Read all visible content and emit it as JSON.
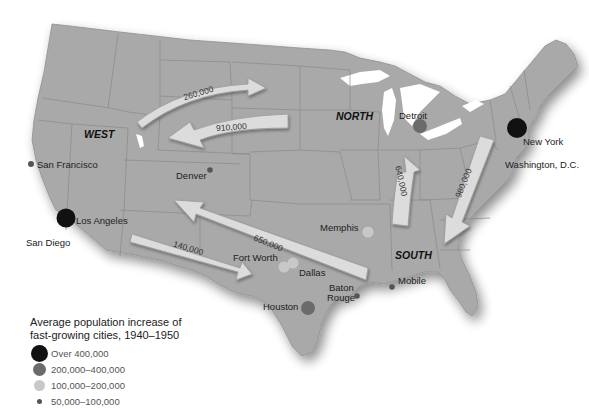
{
  "regions": {
    "west": "WEST",
    "north": "NORTH",
    "south": "SOUTH"
  },
  "cities": [
    {
      "name": "San Francisco",
      "category": "50,000–100,000"
    },
    {
      "name": "Los Angeles",
      "category": "Over 400,000"
    },
    {
      "name": "San Diego",
      "category": "50,000–100,000"
    },
    {
      "name": "Denver",
      "category": "50,000–100,000"
    },
    {
      "name": "Detroit",
      "category": "200,000–400,000"
    },
    {
      "name": "New York",
      "category": "Over 400,000"
    },
    {
      "name": "Washington, D.C.",
      "category": "200,000–400,000"
    },
    {
      "name": "Memphis",
      "category": "100,000–200,000"
    },
    {
      "name": "Fort Worth",
      "category": "100,000–200,000"
    },
    {
      "name": "Dallas",
      "category": "100,000–200,000"
    },
    {
      "name": "Houston",
      "category": "200,000–400,000"
    },
    {
      "name": "Baton Rouge",
      "category": "50,000–100,000"
    },
    {
      "name": "Mobile",
      "category": "50,000–100,000"
    }
  ],
  "labels": {
    "san_francisco": "San Francisco",
    "los_angeles": "Los Angeles",
    "san_diego": "San Diego",
    "denver": "Denver",
    "detroit": "Detroit",
    "new_york": "New York",
    "washington": "Washington, D.C.",
    "memphis": "Memphis",
    "fort_worth": "Fort Worth",
    "dallas": "Dallas",
    "houston": "Houston",
    "baton": "Baton",
    "rouge": "Rouge",
    "mobile": "Mobile"
  },
  "migration_arrows": [
    {
      "value": "260,000",
      "from": "West",
      "to": "Plains (east)"
    },
    {
      "value": "910,000",
      "from": "North",
      "to": "West"
    },
    {
      "value": "650,000",
      "from": "South",
      "to": "West"
    },
    {
      "value": "140,000",
      "from": "West",
      "to": "South (Texas)"
    },
    {
      "value": "640,000",
      "from": "South",
      "to": "North"
    },
    {
      "value": "980,000",
      "from": "Northeast",
      "to": "South"
    }
  ],
  "arrow_labels": {
    "a260": "260,000",
    "a910": "910,000",
    "a650": "650,000",
    "a140": "140,000",
    "a640": "640,000",
    "a980": "980,000"
  },
  "legend": {
    "title_line1": "Average population increase of",
    "title_line2": "fast-growing cities, 1940–1950",
    "items": [
      {
        "label": "Over 400,000",
        "color": "#111111",
        "size": 22
      },
      {
        "label": "200,000–400,000",
        "color": "#6b6b6b",
        "size": 15
      },
      {
        "label": "100,000–200,000",
        "color": "#c8c8c8",
        "size": 12
      },
      {
        "label": "50,000–100,000",
        "color": "#555555",
        "size": 6
      }
    ]
  },
  "colors": {
    "land": "#a9a9a9",
    "state_border": "#8a8a8a",
    "water": "#ffffff",
    "arrow_fill": "#dcdcdc",
    "arrow_stroke": "#9a9a9a"
  }
}
